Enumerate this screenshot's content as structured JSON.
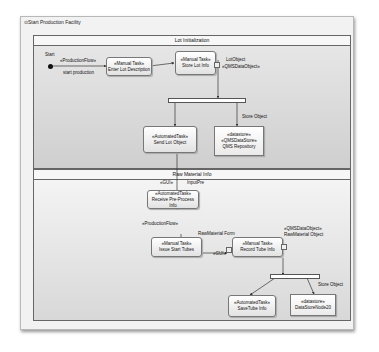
{
  "diagram": {
    "title": "Start Production Facility",
    "partitions": [
      {
        "name": "Lot Initialization"
      },
      {
        "name": "Raw Material Info"
      }
    ],
    "start": {
      "label": "Start",
      "flow_stereotype": "«ProductionFlow»",
      "flow_label": "start production"
    },
    "nodes": {
      "enter_lot": {
        "stereotype": "«Manual Task»",
        "name": "Enter Lot Description"
      },
      "store_lot": {
        "stereotype": "«Manual Task»",
        "name": "Store Lot Info"
      },
      "send_lot": {
        "stereotype": "«AutomatedTask»",
        "name": "Send Lot Object"
      },
      "qms_repo": {
        "stereotype": "«datastore»",
        "stereotype2": "«QMSDataStore»",
        "name": "QMS Repository"
      },
      "receive_pre": {
        "stereotype": "«AutomatedTask»",
        "name": "Receive Pre-Process Info"
      },
      "issue_tubes": {
        "stereotype": "«Manual Task»",
        "name": "Issue Start Tubes"
      },
      "record_tube": {
        "stereotype": "«Manual Task»",
        "name": "Record Tube Info"
      },
      "save_tube": {
        "stereotype": "«AutomatedTask»",
        "name": "SaveTube Info"
      },
      "datastore20": {
        "stereotype": "«datastore»",
        "name": "DataStoreNode20"
      }
    },
    "labels": {
      "lot_object": "LotObject",
      "qms_data_object": "«QMSDataObject»",
      "store_object_1": "Store Object",
      "gui": "«GUI»",
      "input_pre": "InputPre",
      "production_flow": "«ProductionFlow»",
      "raw_material_form": "RawMaterial Form",
      "gui2": "«GUI»",
      "qms_data_object_2": "«QMSDataObject»",
      "raw_material_object": "RawMaterial Object",
      "store_object_2": "Store Object"
    }
  }
}
